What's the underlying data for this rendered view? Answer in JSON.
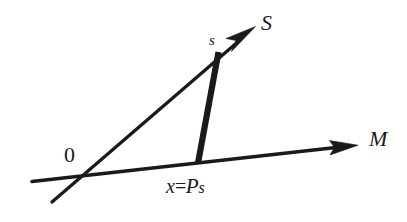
{
  "figure": {
    "background_color": "#ffffff",
    "stroke_color": "#1a1a1a",
    "width": 407,
    "height": 222,
    "labels": {
      "ray_s_axis": "S",
      "point_s": "s",
      "ray_m_axis": "M",
      "origin": "0",
      "projection_x": "x",
      "projection_equals": "=",
      "projection_operator": "P",
      "projection_operand": "s"
    },
    "elements": [
      {
        "name": "ray-S",
        "kind": "line-with-arrowhead",
        "from": [
          52,
          202
        ],
        "to": [
          255,
          27
        ],
        "stroke_width": 3.2,
        "arrow": true
      },
      {
        "name": "ray-M",
        "kind": "line-with-arrowhead",
        "from": [
          32,
          181
        ],
        "to": [
          358,
          145
        ],
        "stroke_width": 3.2,
        "arrow": true
      },
      {
        "name": "projection-segment",
        "kind": "thick-segment",
        "from": [
          218,
          52
        ],
        "to": [
          198,
          162
        ],
        "stroke_width": 6.5,
        "arrow": false
      }
    ],
    "points": {
      "origin": [
        76,
        168
      ],
      "s": [
        218,
        52
      ],
      "x_equals_Ps": [
        198,
        162
      ]
    }
  }
}
